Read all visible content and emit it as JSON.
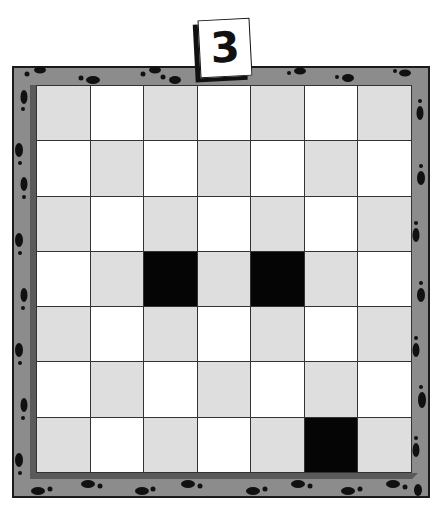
{
  "puzzle": {
    "number_tile": "3",
    "rows": 7,
    "cols": 7,
    "colors": {
      "frame": "#8c8c8c",
      "frame_border": "#1a1a1a",
      "light_cell": "#ffffff",
      "gray_cell": "#dedede",
      "black_cell": "#050505",
      "footprint": "#111111"
    },
    "grid": [
      [
        "gray",
        "white",
        "gray",
        "white",
        "gray",
        "white",
        "gray"
      ],
      [
        "white",
        "gray",
        "white",
        "gray",
        "white",
        "gray",
        "white"
      ],
      [
        "gray",
        "white",
        "gray",
        "white",
        "gray",
        "white",
        "gray"
      ],
      [
        "white",
        "gray",
        "black",
        "gray",
        "black",
        "gray",
        "white"
      ],
      [
        "gray",
        "white",
        "gray",
        "white",
        "gray",
        "white",
        "gray"
      ],
      [
        "white",
        "gray",
        "white",
        "gray",
        "white",
        "gray",
        "white"
      ],
      [
        "gray",
        "white",
        "gray",
        "white",
        "gray",
        "black",
        "gray"
      ]
    ],
    "black_cells": [
      [
        3,
        2
      ],
      [
        3,
        4
      ],
      [
        6,
        5
      ]
    ],
    "frame_decoration": "footprints-icon"
  }
}
